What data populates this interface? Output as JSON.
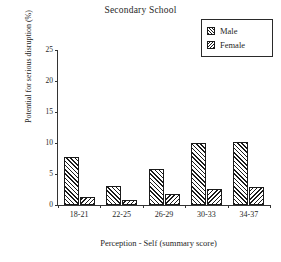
{
  "chart_data": {
    "type": "bar",
    "title": "Secondary School",
    "xlabel": "Perception - Self (summary score)",
    "ylabel": "Potential for serious disruption (%)",
    "categories": [
      "18-21",
      "22-25",
      "26-29",
      "30-33",
      "34-37"
    ],
    "series": [
      {
        "name": "Male",
        "values": [
          7.8,
          3.0,
          5.8,
          10.0,
          10.1
        ]
      },
      {
        "name": "Female",
        "values": [
          1.3,
          0.8,
          1.8,
          2.6,
          2.9
        ]
      }
    ],
    "ylim": [
      0,
      25
    ],
    "yticks": [
      0,
      5,
      10,
      15,
      20,
      25
    ],
    "ytick_labels": [
      "0",
      "5",
      "10",
      "15",
      "20",
      "25"
    ],
    "grid": false,
    "legend_position": "top-right",
    "legend": [
      {
        "label": "Male",
        "pattern": "diagonal-forward-hatch",
        "swatch_icon": "hatch-swatch-male"
      },
      {
        "label": "Female",
        "pattern": "diagonal-back-hatch",
        "swatch_icon": "hatch-swatch-female"
      }
    ],
    "colors": {
      "ink": "#1a1a1a",
      "axis": "#333333",
      "background": "#ffffff"
    }
  }
}
